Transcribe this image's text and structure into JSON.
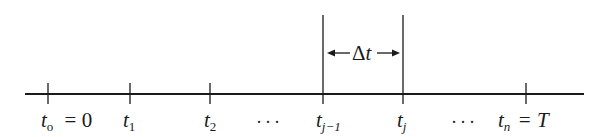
{
  "diagram": {
    "type": "time-axis-partition",
    "axis": {
      "x_start": 25,
      "x_end": 584,
      "y": 94,
      "color": "#1a1a1a"
    },
    "ticks": [
      {
        "id": "t0",
        "x": 48,
        "var": "t",
        "sub": "o",
        "suffix": " = 0",
        "tall": false
      },
      {
        "id": "t1",
        "x": 130,
        "var": "t",
        "sub": "1",
        "suffix": "",
        "tall": false
      },
      {
        "id": "t2",
        "x": 210,
        "var": "t",
        "sub": "2",
        "suffix": "",
        "tall": false
      },
      {
        "id": "tj-1",
        "x": 323,
        "var": "t",
        "sub": "j−1",
        "suffix": "",
        "tall": true
      },
      {
        "id": "tj",
        "x": 403,
        "var": "t",
        "sub": "j",
        "suffix": "",
        "tall": true
      },
      {
        "id": "tn",
        "x": 526,
        "var": "t",
        "sub": "n",
        "suffix": " = T",
        "tall": false
      }
    ],
    "ellipses": [
      {
        "id": "dots-1",
        "text": "···",
        "x": 258
      },
      {
        "id": "dots-2",
        "text": "···",
        "x": 452
      }
    ],
    "interval": {
      "symbol": "Δ",
      "var": "t",
      "from": "tj-1",
      "to": "tj",
      "y": 53
    }
  }
}
